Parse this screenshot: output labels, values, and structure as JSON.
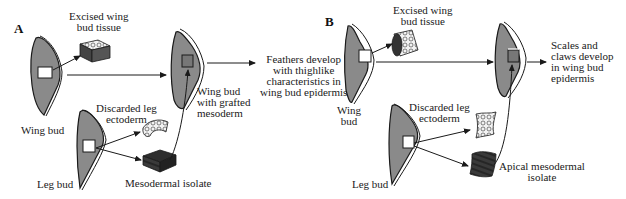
{
  "panels": [
    {
      "letter": "A",
      "labels": {
        "excised": "Excised wing\nbud tissue",
        "wing_bud": "Wing bud",
        "discarded": "Discarded leg\nectoderm",
        "leg_bud": "Leg bud",
        "isolate": "Mesodermal isolate",
        "grafted": "Wing bud\nwith grafted\nmesoderm",
        "result": "Feathers develop\nwith thighlike\ncharacteristics in\nwing bud epidermis"
      }
    },
    {
      "letter": "B",
      "labels": {
        "excised": "Excised wing\nbud tissue",
        "wing_bud": "Wing\nbud",
        "discarded": "Discarded leg\nectoderm",
        "leg_bud": "Leg bud",
        "isolate": "Apical mesodermal\nisolate",
        "result": "Scales and\nclaws develop\nin wing bud\nepidermis"
      }
    }
  ],
  "colors": {
    "bud_fill": "#8a8a8a",
    "outline": "#1a1a1a",
    "tissue_dark": "#3a3a3a",
    "background": "#ffffff"
  }
}
